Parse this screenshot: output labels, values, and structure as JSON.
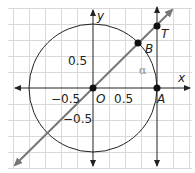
{
  "diagram": {
    "type": "unit-circle-tangent",
    "grid": {
      "cell_value": 0.25,
      "cell_px": 16,
      "color": "#d9d9d9"
    },
    "axes": {
      "x_label": "x",
      "y_label": "y",
      "color": "#222222"
    },
    "circle": {
      "radius": 1,
      "color": "#222222"
    },
    "ray": {
      "slope_deg": 45,
      "color": "#777777"
    },
    "tangent_line": {
      "x": 1,
      "color": "#222222"
    },
    "points": [
      {
        "id": "O",
        "label": "O",
        "x": 0,
        "y": 0
      },
      {
        "id": "A",
        "label": "A",
        "x": 1,
        "y": 0
      },
      {
        "id": "B",
        "label": "B",
        "x": 0.707,
        "y": 0.707
      },
      {
        "id": "T",
        "label": "T",
        "x": 1,
        "y": 1.1
      }
    ],
    "tick_labels": {
      "x_pos": "0.5",
      "x_neg": "−0.5",
      "y_pos": "0.5",
      "y_neg": "−0.5"
    },
    "angle_label": "α",
    "angle_color": "#8a8a8a"
  }
}
